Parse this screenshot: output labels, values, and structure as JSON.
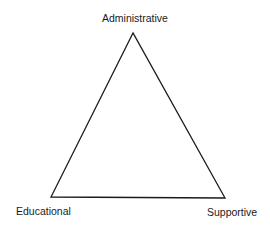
{
  "diagram": {
    "type": "triangle",
    "vertices": {
      "top": {
        "label": "Administrative"
      },
      "bottom_left": {
        "label": "Educational"
      },
      "bottom_right": {
        "label": "Supportive"
      }
    },
    "stroke_color": "#1a1a1a",
    "background": "#ffffff"
  }
}
